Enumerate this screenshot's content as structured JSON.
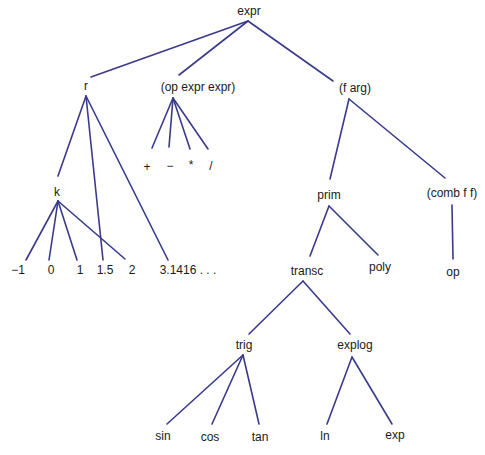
{
  "diagram": {
    "type": "tree",
    "edge_color": "#3a3a8c",
    "nodes": [
      {
        "id": "expr",
        "label": "expr",
        "x": 249,
        "y": 11
      },
      {
        "id": "r",
        "label": "r",
        "x": 86,
        "y": 86
      },
      {
        "id": "opee",
        "label": "(op expr expr)",
        "x": 198,
        "y": 87
      },
      {
        "id": "farg",
        "label": "(f arg)",
        "x": 355,
        "y": 88
      },
      {
        "id": "plus",
        "label": "+",
        "x": 147,
        "y": 167
      },
      {
        "id": "minus",
        "label": "−",
        "x": 170,
        "y": 166
      },
      {
        "id": "times",
        "label": "*",
        "x": 191,
        "y": 165
      },
      {
        "id": "div",
        "label": "/",
        "x": 211,
        "y": 166
      },
      {
        "id": "k",
        "label": "k",
        "x": 57,
        "y": 192
      },
      {
        "id": "n_m1",
        "label": "−1",
        "x": 18,
        "y": 270
      },
      {
        "id": "n_0",
        "label": "0",
        "x": 51,
        "y": 270
      },
      {
        "id": "n_1",
        "label": "1",
        "x": 80,
        "y": 270
      },
      {
        "id": "n_1_5",
        "label": "1.5",
        "x": 105,
        "y": 270
      },
      {
        "id": "n_2",
        "label": "2",
        "x": 132,
        "y": 270
      },
      {
        "id": "n_pi",
        "label": "3.1416 . . .",
        "x": 188,
        "y": 270
      },
      {
        "id": "prim",
        "label": "prim",
        "x": 329,
        "y": 195
      },
      {
        "id": "comb",
        "label": "(comb f f)",
        "x": 452,
        "y": 193
      },
      {
        "id": "transc",
        "label": "transc",
        "x": 307,
        "y": 271
      },
      {
        "id": "poly",
        "label": "poly",
        "x": 380,
        "y": 267
      },
      {
        "id": "op",
        "label": "op",
        "x": 453,
        "y": 272
      },
      {
        "id": "trig",
        "label": "trig",
        "x": 244,
        "y": 345
      },
      {
        "id": "explog",
        "label": "explog",
        "x": 355,
        "y": 345
      },
      {
        "id": "sin",
        "label": "sin",
        "x": 163,
        "y": 436
      },
      {
        "id": "cos",
        "label": "cos",
        "x": 210,
        "y": 437
      },
      {
        "id": "tan",
        "label": "tan",
        "x": 260,
        "y": 437
      },
      {
        "id": "ln",
        "label": "ln",
        "x": 325,
        "y": 436
      },
      {
        "id": "exp",
        "label": "exp",
        "x": 395,
        "y": 435
      }
    ],
    "edges": [
      {
        "from": "expr",
        "to": "r",
        "x1": 248,
        "y1": 21,
        "x2": 91,
        "y2": 77
      },
      {
        "from": "expr",
        "to": "opee",
        "x1": 248,
        "y1": 21,
        "x2": 179,
        "y2": 75
      },
      {
        "from": "expr",
        "to": "farg",
        "x1": 248,
        "y1": 21,
        "x2": 333,
        "y2": 81
      },
      {
        "from": "r",
        "to": "k",
        "x1": 86,
        "y1": 96,
        "x2": 58,
        "y2": 176
      },
      {
        "from": "r",
        "to": "1.5",
        "x1": 86,
        "y1": 96,
        "x2": 103,
        "y2": 260
      },
      {
        "from": "r",
        "to": "3.1416",
        "x1": 86,
        "y1": 96,
        "x2": 168,
        "y2": 260
      },
      {
        "from": "opee",
        "to": "+",
        "x1": 173,
        "y1": 98,
        "x2": 152,
        "y2": 148
      },
      {
        "from": "opee",
        "to": "-",
        "x1": 173,
        "y1": 98,
        "x2": 169,
        "y2": 147
      },
      {
        "from": "opee",
        "to": "*",
        "x1": 173,
        "y1": 98,
        "x2": 190,
        "y2": 149
      },
      {
        "from": "opee",
        "to": "/",
        "x1": 173,
        "y1": 98,
        "x2": 208,
        "y2": 149
      },
      {
        "from": "k",
        "to": "-1",
        "x1": 58,
        "y1": 201,
        "x2": 26,
        "y2": 260
      },
      {
        "from": "k",
        "to": "0",
        "x1": 58,
        "y1": 201,
        "x2": 49,
        "y2": 260
      },
      {
        "from": "k",
        "to": "1",
        "x1": 58,
        "y1": 201,
        "x2": 77,
        "y2": 260
      },
      {
        "from": "k",
        "to": "2",
        "x1": 58,
        "y1": 201,
        "x2": 125,
        "y2": 259
      },
      {
        "from": "farg",
        "to": "prim",
        "x1": 349,
        "y1": 99,
        "x2": 330,
        "y2": 179
      },
      {
        "from": "farg",
        "to": "comb",
        "x1": 349,
        "y1": 99,
        "x2": 445,
        "y2": 178
      },
      {
        "from": "comb",
        "to": "op",
        "x1": 452,
        "y1": 205,
        "x2": 453,
        "y2": 259
      },
      {
        "from": "prim",
        "to": "transc",
        "x1": 329,
        "y1": 206,
        "x2": 310,
        "y2": 256
      },
      {
        "from": "prim",
        "to": "poly",
        "x1": 329,
        "y1": 206,
        "x2": 378,
        "y2": 255
      },
      {
        "from": "transc",
        "to": "trig",
        "x1": 303,
        "y1": 281,
        "x2": 249,
        "y2": 334
      },
      {
        "from": "transc",
        "to": "explog",
        "x1": 303,
        "y1": 281,
        "x2": 350,
        "y2": 334
      },
      {
        "from": "trig",
        "to": "sin",
        "x1": 243,
        "y1": 355,
        "x2": 167,
        "y2": 424
      },
      {
        "from": "trig",
        "to": "cos",
        "x1": 243,
        "y1": 355,
        "x2": 212,
        "y2": 424
      },
      {
        "from": "trig",
        "to": "tan",
        "x1": 243,
        "y1": 355,
        "x2": 259,
        "y2": 424
      },
      {
        "from": "explog",
        "to": "ln",
        "x1": 352,
        "y1": 357,
        "x2": 327,
        "y2": 424
      },
      {
        "from": "explog",
        "to": "exp",
        "x1": 352,
        "y1": 357,
        "x2": 392,
        "y2": 424
      }
    ]
  }
}
